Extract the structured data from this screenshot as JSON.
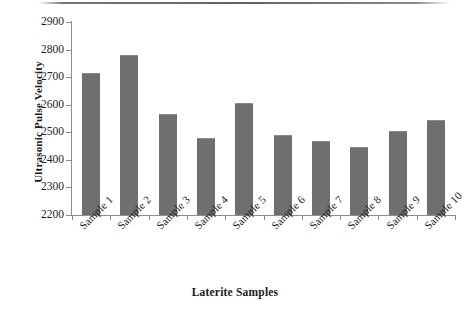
{
  "chart_data": {
    "type": "bar",
    "title": "",
    "xlabel": "Laterite Samples",
    "ylabel": "Ultrasonic Pulse Velocity",
    "categories": [
      "Sample 1",
      "Sample 2",
      "Sample 3",
      "Sample 4",
      "Sample 5",
      "Sample 6",
      "Sample 7",
      "Sample 8",
      "Sample 9",
      "Sample 10"
    ],
    "values": [
      2715,
      2780,
      2565,
      2480,
      2605,
      2490,
      2470,
      2445,
      2505,
      2545
    ],
    "ylim": [
      2200,
      2900
    ],
    "ytick_step": 100,
    "yticks": [
      2200,
      2300,
      2400,
      2500,
      2600,
      2700,
      2800,
      2900
    ],
    "ytick_labels": [
      "2200",
      "2300",
      "2400",
      "2500",
      "2600",
      "2700",
      "2800",
      "2900"
    ],
    "grid": false,
    "legend": null,
    "series": [
      {
        "name": "Ultrasonic Pulse Velocity",
        "values": [
          2715,
          2780,
          2565,
          2480,
          2605,
          2490,
          2470,
          2445,
          2505,
          2545
        ]
      }
    ],
    "bar_color": "#6f6f6f",
    "axis_color": "#8d8d8d",
    "text_color": "#1c1c1c"
  }
}
